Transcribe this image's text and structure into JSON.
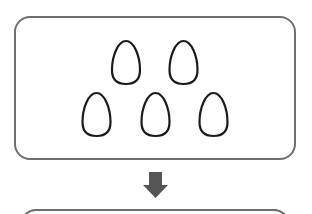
{
  "diagram": {
    "type": "process-flow",
    "top_panel": {
      "content": "eggs",
      "egg_count": 5,
      "rows": [
        {
          "eggs": 2
        },
        {
          "eggs": 3
        }
      ]
    },
    "arrow": {
      "direction": "down",
      "color": "#555555"
    },
    "bottom_panel": {
      "content": "partially visible (cropped)"
    },
    "colors": {
      "panel_border": "#6e6e6e",
      "egg_outline": "#1a1a1a",
      "arrow": "#555555",
      "background": "#ffffff"
    }
  }
}
